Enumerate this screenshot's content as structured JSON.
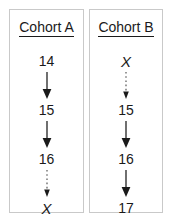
{
  "figure": {
    "type": "diagram",
    "border_color": "#c9c9c9",
    "text_color": "#1a1a1a"
  },
  "cohorts": [
    {
      "id": "cohort-a",
      "title": "Cohort A",
      "nodes": [
        {
          "label": "14",
          "style": "number"
        },
        {
          "label": "15",
          "style": "number"
        },
        {
          "label": "16",
          "style": "number"
        },
        {
          "label": "X",
          "style": "variable"
        }
      ],
      "arrows": [
        {
          "style": "solid"
        },
        {
          "style": "solid"
        },
        {
          "style": "dotted"
        }
      ]
    },
    {
      "id": "cohort-b",
      "title": "Cohort B",
      "nodes": [
        {
          "label": "X",
          "style": "variable"
        },
        {
          "label": "15",
          "style": "number"
        },
        {
          "label": "16",
          "style": "number"
        },
        {
          "label": "17",
          "style": "number"
        }
      ],
      "arrows": [
        {
          "style": "dotted"
        },
        {
          "style": "solid"
        },
        {
          "style": "solid"
        }
      ]
    }
  ]
}
